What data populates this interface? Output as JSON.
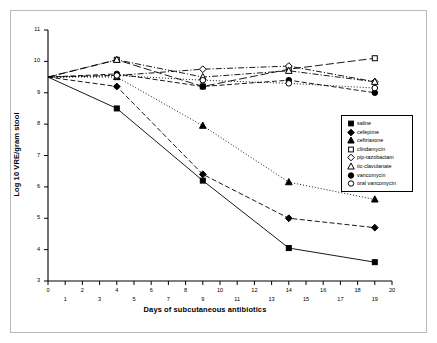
{
  "chart": {
    "type": "line",
    "xlabel": "Days of subcutaneous antibiotics",
    "ylabel": "Log 10 VRE/gram stool"
  },
  "axes": {
    "y_ticks": [
      "11",
      "10",
      "9",
      "8",
      "7",
      "6",
      "5",
      "4",
      "3"
    ],
    "x_ticks_even": [
      "0",
      "2",
      "4",
      "6",
      "8",
      "10",
      "12",
      "14",
      "16",
      "18",
      "20"
    ],
    "x_ticks_odd": [
      "1",
      "3",
      "5",
      "7",
      "9",
      "11",
      "13",
      "15",
      "17",
      "19"
    ]
  },
  "legend": {
    "items": [
      {
        "label": "saline",
        "marker": "filled-square"
      },
      {
        "label": "cefepime",
        "marker": "filled-diamond"
      },
      {
        "label": "ceftriaxone",
        "marker": "filled-triangle"
      },
      {
        "label": "clindamycin",
        "marker": "open-square"
      },
      {
        "label": "pip-tazobactam",
        "marker": "open-diamond"
      },
      {
        "label": "tic-clavulanate",
        "marker": "open-triangle"
      },
      {
        "label": "vancomycin",
        "marker": "filled-circle"
      },
      {
        "label": "oral vancomycin",
        "marker": "open-circle"
      }
    ]
  },
  "chart_data": {
    "type": "line",
    "title": "",
    "xlabel": "Days of subcutaneous antibiotics",
    "ylabel": "Log 10 VRE/gram stool",
    "xlim": [
      0,
      20
    ],
    "ylim": [
      3,
      11
    ],
    "x": [
      0,
      4,
      9,
      14,
      19
    ],
    "grid": false,
    "legend_position": "right",
    "series": [
      {
        "name": "saline",
        "marker": "filled-square",
        "line": "solid",
        "values": [
          9.5,
          8.5,
          6.2,
          4.05,
          3.6
        ]
      },
      {
        "name": "cefepime",
        "marker": "filled-diamond",
        "line": "dashed",
        "values": [
          9.5,
          9.2,
          6.4,
          5.0,
          4.7
        ]
      },
      {
        "name": "ceftriaxone",
        "marker": "filled-triangle",
        "line": "dotted",
        "values": [
          9.5,
          9.5,
          7.95,
          6.15,
          5.6
        ]
      },
      {
        "name": "clindamycin",
        "marker": "open-square",
        "line": "long-dash",
        "values": [
          9.5,
          10.05,
          9.2,
          9.75,
          10.1
        ]
      },
      {
        "name": "pip-tazobactam",
        "marker": "open-diamond",
        "line": "dash-dot",
        "values": [
          9.5,
          9.55,
          9.75,
          9.85,
          9.35
        ]
      },
      {
        "name": "tic-clavulanate",
        "marker": "open-triangle",
        "line": "dash-dot",
        "values": [
          9.5,
          10.05,
          9.5,
          9.7,
          9.35
        ]
      },
      {
        "name": "vancomycin",
        "marker": "filled-circle",
        "line": "dashed",
        "values": [
          9.5,
          9.6,
          9.2,
          9.4,
          9.0
        ]
      },
      {
        "name": "oral vancomycin",
        "marker": "open-circle",
        "line": "dotted",
        "values": [
          9.5,
          9.55,
          9.4,
          9.3,
          9.15
        ]
      }
    ]
  }
}
